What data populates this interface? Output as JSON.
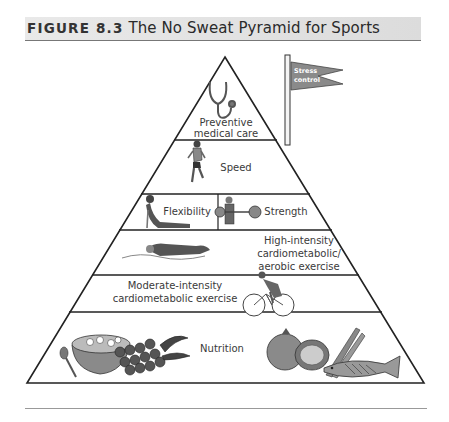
{
  "figure": {
    "label": "FIGURE 8.3",
    "title": "The No Sweat Pyramid for Sports"
  },
  "flag": {
    "line1": "Stress",
    "line2": "control",
    "icon": "flag-icon"
  },
  "tiers": [
    {
      "level": 1,
      "lines": [
        "Preventive",
        "medical care"
      ],
      "icon": "stethoscope-icon"
    },
    {
      "level": 2,
      "lines": [
        "Speed"
      ],
      "icon": "runner-icon"
    },
    {
      "level": 3,
      "left": {
        "lines": [
          "Flexibility"
        ],
        "icon": "stretching-person-icon"
      },
      "right": {
        "lines": [
          "Strength"
        ],
        "icon": "weightlifter-icon"
      }
    },
    {
      "level": 4,
      "lines": [
        "High-intensity",
        "cardiometabolic/",
        "aerobic exercise"
      ],
      "icon": "swimmer-icon"
    },
    {
      "level": 5,
      "lines": [
        "Moderate-intensity",
        "cardiometabolic exercise"
      ],
      "icon": "cyclist-icon"
    },
    {
      "level": 6,
      "lines": [
        "Nutrition"
      ],
      "icons": [
        "cereal-bowl-icon",
        "spoon-icon",
        "grapes-icon",
        "fruit-icon",
        "asparagus-icon",
        "fish-icon"
      ]
    }
  ]
}
